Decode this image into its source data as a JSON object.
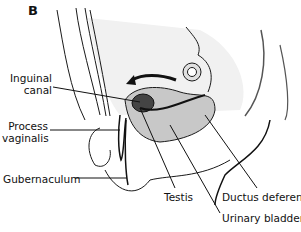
{
  "figure": {
    "panel_letter": "B",
    "labels": {
      "inguinal_canal_line1": "Inguinal",
      "inguinal_canal_line2": "canal",
      "process_vaginalis_line1": "Process",
      "process_vaginalis_line2": "vaginalis",
      "gubernaculum": "Gubernaculum",
      "testis": "Testis",
      "ductus_deferens": "Ductus deferens",
      "urinary_bladder": "Urinary bladder"
    },
    "colors": {
      "line": "#1a1a1a",
      "shade_light": "#ececec",
      "shade_mid": "#c8c8c8",
      "shade_dark": "#444444"
    }
  }
}
